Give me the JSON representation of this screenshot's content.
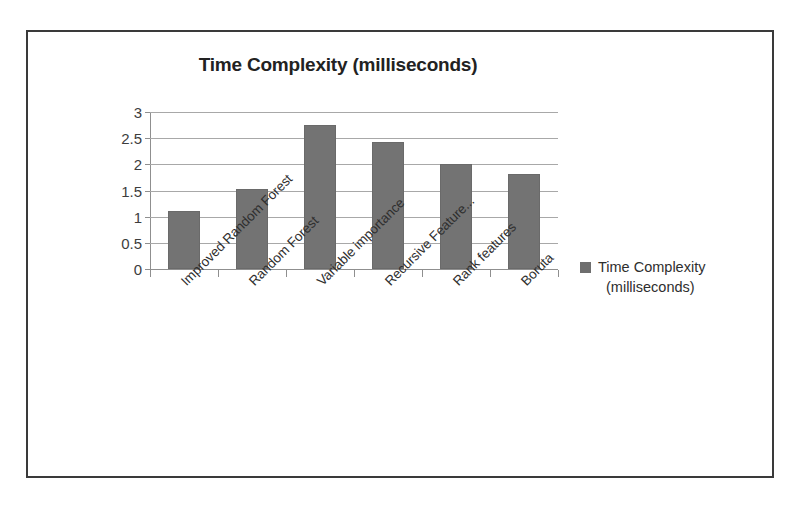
{
  "chart_data": {
    "type": "bar",
    "title": "Time Complexity (milliseconds)",
    "xlabel": "",
    "ylabel": "",
    "ylim": [
      0,
      3
    ],
    "ytick_labels": [
      "3",
      "2.5",
      "2",
      "1.5",
      "1",
      "0.5",
      "0"
    ],
    "yticks": [
      3,
      2.5,
      2,
      1.5,
      1,
      0.5,
      0
    ],
    "grid": true,
    "legend_position": "right",
    "legend": [
      "Time Complexity (milliseconds)"
    ],
    "categories": [
      "Improved Random Forest",
      "Random Forest",
      "Variable importance",
      "Recursive Feature...",
      "Rank features",
      "Boruta"
    ],
    "values": [
      1.11,
      1.53,
      2.75,
      2.43,
      2.0,
      1.82
    ],
    "series": [
      {
        "name": "Time Complexity (milliseconds)",
        "values": [
          1.11,
          1.53,
          2.75,
          2.43,
          2.0,
          1.82
        ]
      }
    ],
    "bar_color": "#737373"
  },
  "legend_block": {
    "label_line1": "Time Complexity",
    "label_line2": "(milliseconds)",
    "swatch_color": "#6e6e6e",
    "swatch_icon": "square-marker-icon"
  },
  "frame": {
    "border_color": "#3a3a3a",
    "background": "#ffffff"
  }
}
